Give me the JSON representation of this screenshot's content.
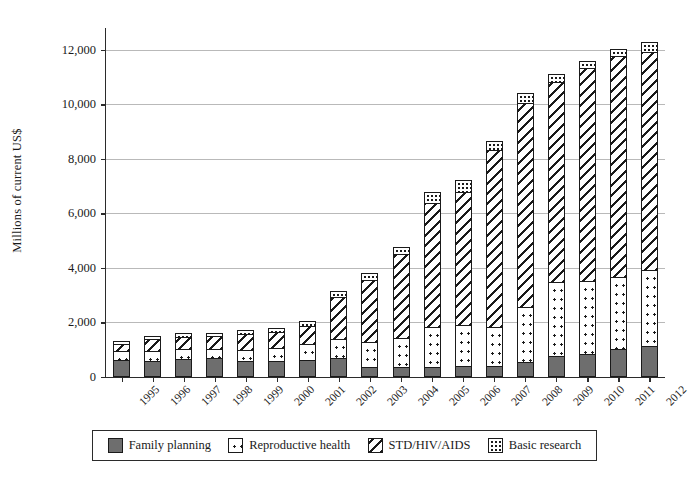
{
  "chart_data": {
    "type": "bar",
    "subtype": "stacked",
    "title": "",
    "xlabel": "",
    "ylabel": "Millions of current US$",
    "ylim": [
      0,
      12800
    ],
    "ytick_values": [
      0,
      2000,
      4000,
      6000,
      8000,
      10000,
      12000
    ],
    "ytick_labels": [
      "0",
      "2,000",
      "4,000",
      "6,000",
      "8,000",
      "10,000",
      "12,000"
    ],
    "grid": "horizontal",
    "legend_position": "bottom",
    "categories": [
      "1995",
      "1996",
      "1997",
      "1998",
      "1999",
      "2000",
      "2001",
      "2002",
      "2003",
      "2004",
      "2005",
      "2006",
      "2007",
      "2008",
      "2009",
      "2010",
      "2011",
      "2012"
    ],
    "series": [
      {
        "name": "Family planning",
        "pattern": "solid-gray",
        "color": "#6e6e6e",
        "values": [
          620,
          600,
          660,
          700,
          600,
          590,
          610,
          700,
          370,
          380,
          380,
          400,
          420,
          560,
          780,
          860,
          1020,
          1120
        ]
      },
      {
        "name": "Reproductive health",
        "pattern": "dotted",
        "color": "#ffffff",
        "values": [
          330,
          340,
          360,
          330,
          400,
          490,
          610,
          680,
          900,
          1060,
          1460,
          1490,
          1420,
          2000,
          2720,
          2680,
          2650,
          2800
        ]
      },
      {
        "name": "STD/HIV/AIDS",
        "pattern": "diagonal-hatch",
        "color": "#ffffff",
        "values": [
          280,
          440,
          460,
          470,
          580,
          580,
          660,
          1540,
          2300,
          3080,
          4540,
          4900,
          6500,
          7500,
          7320,
          7790,
          8100,
          8000
        ]
      },
      {
        "name": "Basic research",
        "pattern": "speckle",
        "color": "#ffffff",
        "values": [
          110,
          120,
          120,
          120,
          130,
          140,
          170,
          240,
          250,
          250,
          400,
          420,
          320,
          340,
          290,
          270,
          250,
          380
        ]
      }
    ],
    "totals": [
      1340,
      1500,
      1600,
      1620,
      1710,
      1800,
      2050,
      3160,
      3820,
      4770,
      6780,
      7210,
      8660,
      10400,
      11110,
      11600,
      12020,
      12300
    ]
  },
  "legend": {
    "items": [
      {
        "label": "Family planning",
        "pattern": "solid-gray"
      },
      {
        "label": "Reproductive health",
        "pattern": "dotted"
      },
      {
        "label": "STD/HIV/AIDS",
        "pattern": "diagonal-hatch"
      },
      {
        "label": "Basic research",
        "pattern": "speckle"
      }
    ]
  }
}
